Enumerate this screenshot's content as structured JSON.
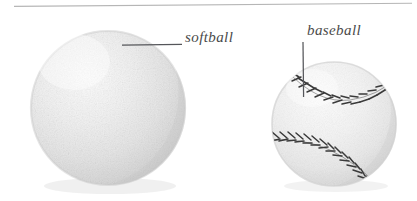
{
  "figure": {
    "background_color": "#ffffff",
    "top_rule": {
      "name": "horizontal-rule",
      "color": "#b6b6b6",
      "x1": 14,
      "y1": 6,
      "x2": 412,
      "y2": 3
    }
  },
  "labels": {
    "softball": "softball",
    "baseball": "baseball"
  },
  "leaders": {
    "softball": {
      "orientation": "horizontal",
      "x1": 122,
      "y1": 45,
      "x2": 182,
      "y2": 45,
      "color": "#55565a"
    },
    "baseball": {
      "orientation": "vertical",
      "x1": 303,
      "y1": 42,
      "x2": 303,
      "y2": 97,
      "color": "#55565a"
    }
  },
  "objects": [
    {
      "name": "softball",
      "label": "softball",
      "shape": "sphere",
      "center_x": 108,
      "center_y": 108,
      "radius": 77,
      "fill_color": "#ebebeb",
      "highlight_color": "#f8f8f8",
      "shadow_color": "#c8c8c8",
      "edge_color": "#d4d4d4",
      "has_seams": false,
      "texture": "stippled"
    },
    {
      "name": "baseball",
      "label": "baseball",
      "shape": "sphere",
      "center_x": 334,
      "center_y": 124,
      "radius": 62,
      "fill_color": "#efefef",
      "highlight_color": "#fbfbfb",
      "shadow_color": "#cfcfcf",
      "edge_color": "#d8d8d8",
      "has_seams": true,
      "seam_color": "#3a3a3a",
      "seam_count": 2,
      "stitches_per_seam": 17,
      "texture": "stippled"
    }
  ],
  "colors": {
    "ink": "#4a4a4a",
    "rule": "#b6b6b6",
    "leader": "#55565a",
    "seam": "#3a3a3a",
    "paper": "#ffffff"
  }
}
